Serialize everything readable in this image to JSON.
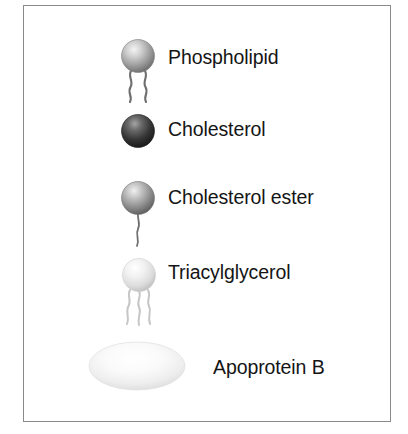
{
  "figure": {
    "kind": "lipoprotein-component-legend",
    "frame": {
      "border_color": "#8a8a8a",
      "background": "#ffffff"
    }
  },
  "legend": {
    "items": [
      {
        "id": "phospholipid",
        "label": "Phospholipid",
        "glyph": "sphere-with-two-wavy-tails",
        "sphere_shade": "medium-gray",
        "sphere_color": "#9a9a9a",
        "highlight_color": "#f2f2f2",
        "tail_count": 2,
        "tail_color": "#6e6e6e"
      },
      {
        "id": "cholesterol",
        "label": "Cholesterol",
        "glyph": "dark-sphere",
        "sphere_shade": "dark-gray",
        "sphere_color": "#2b2b2b",
        "highlight_color": "#a8a8a8",
        "tail_count": 0,
        "tail_color": "#2b2b2b"
      },
      {
        "id": "cholesterol-ester",
        "label": "Cholesterol ester",
        "glyph": "sphere-with-one-wavy-tail",
        "sphere_shade": "medium-gray",
        "sphere_color": "#8e8e8e",
        "highlight_color": "#efefef",
        "tail_count": 1,
        "tail_color": "#707070"
      },
      {
        "id": "triacylglycerol",
        "label": "Triacylglycerol",
        "glyph": "sphere-with-three-wavy-tails",
        "sphere_shade": "light-gray",
        "sphere_color": "#dcdcdc",
        "highlight_color": "#fcfcfc",
        "tail_count": 3,
        "tail_color": "#c6c6c6"
      },
      {
        "id": "apoprotein-b",
        "label": "Apoprotein B",
        "glyph": "pale-ellipse",
        "sphere_shade": "very-light-gray",
        "sphere_color": "#ededed",
        "highlight_color": "#ffffff",
        "tail_count": 0,
        "tail_color": "#e4e4e4"
      }
    ]
  }
}
